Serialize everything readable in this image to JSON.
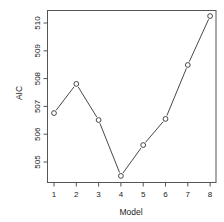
{
  "chart_data": {
    "type": "line",
    "title": "",
    "xlabel": "Model",
    "ylabel": "AIC",
    "x": [
      1,
      2,
      3,
      4,
      5,
      6,
      7,
      8
    ],
    "values": [
      506.76,
      507.81,
      506.51,
      504.5,
      505.61,
      506.55,
      508.49,
      510.25
    ],
    "xticks": [
      "1",
      "2",
      "3",
      "4",
      "5",
      "6",
      "7",
      "8"
    ],
    "yticks": [
      "505",
      "506",
      "507",
      "508",
      "509",
      "510"
    ],
    "xlim": [
      0.7,
      8.3
    ],
    "ylim": [
      504.28,
      510.48
    ],
    "grid": false,
    "legend": null,
    "marker": "open-circle",
    "line_color": "#333333"
  }
}
